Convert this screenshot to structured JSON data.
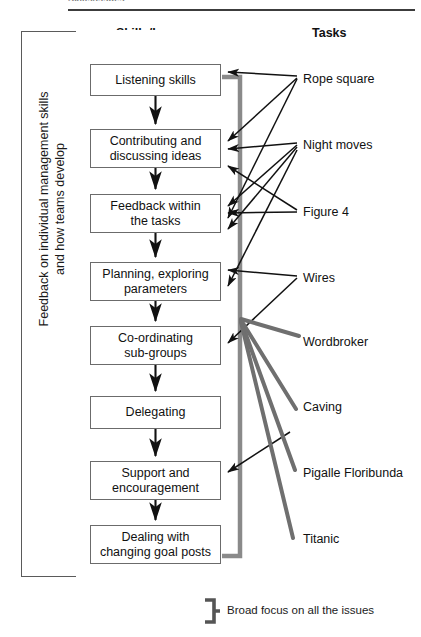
{
  "page": {
    "top_caption": "Skills/Issues",
    "width": 421,
    "height": 637
  },
  "colors": {
    "line": "#111111",
    "box_border": "#6b6b6b",
    "frame_border": "#5a5a5a",
    "bracket_gray": "#8a8a8a",
    "thick_gray": "#6f6f6f",
    "background": "#ffffff",
    "text": "#111111"
  },
  "headers": {
    "skills": "Skills/Issues",
    "tasks": "Tasks"
  },
  "feedback_frame": {
    "line1": "Feedback on individual management skills",
    "line2": "and how teams develop"
  },
  "process_boxes": [
    {
      "id": "listening-skills",
      "lines": [
        "Listening skills"
      ]
    },
    {
      "id": "contributing-ideas",
      "lines": [
        "Contributing and",
        "discussing ideas"
      ]
    },
    {
      "id": "feedback-tasks",
      "lines": [
        "Feedback within",
        "the tasks"
      ]
    },
    {
      "id": "planning-params",
      "lines": [
        "Planning, exploring",
        "parameters"
      ]
    },
    {
      "id": "coordinating",
      "lines": [
        "Co-ordinating",
        "sub-groups"
      ]
    },
    {
      "id": "delegating",
      "lines": [
        "Delegating"
      ]
    },
    {
      "id": "support",
      "lines": [
        "Support and",
        "encouragement"
      ]
    },
    {
      "id": "dealing-goalposts",
      "lines": [
        "Dealing with",
        "changing goal posts"
      ]
    }
  ],
  "tasks": [
    {
      "id": "rope-square",
      "label": "Rope square"
    },
    {
      "id": "night-moves",
      "label": "Night moves"
    },
    {
      "id": "figure-4",
      "label": "Figure 4"
    },
    {
      "id": "wires",
      "label": "Wires"
    },
    {
      "id": "wordbroker",
      "label": "Wordbroker"
    },
    {
      "id": "caving",
      "label": "Caving"
    },
    {
      "id": "pigalle-floribunda",
      "label": "Pigalle Floribunda"
    },
    {
      "id": "titanic",
      "label": "Titanic"
    }
  ],
  "legend": {
    "bracket_note": "Broad focus on all the issues"
  },
  "diagram_data": {
    "type": "flow-diagram",
    "description": "Left frame labels overall feedback theme; centre column is a top-to-bottom sequence of skills/issues boxes linked by down arrows; right column lists tasks, each linked by arrows to one or more skills boxes; a grey bracket marks tasks with broad focus on all the issues.",
    "sequence_flow": [
      "listening-skills",
      "contributing-ideas",
      "feedback-tasks",
      "planning-params",
      "coordinating",
      "delegating",
      "support",
      "dealing-goalposts"
    ],
    "task_links": [
      {
        "task": "rope-square",
        "targets": [
          "listening-skills",
          "contributing-ideas",
          "feedback-tasks"
        ]
      },
      {
        "task": "night-moves",
        "targets": [
          "contributing-ideas",
          "feedback-tasks",
          "planning-params",
          "coordinating"
        ]
      },
      {
        "task": "figure-4",
        "targets": [
          "feedback-tasks",
          "contributing-ideas"
        ]
      },
      {
        "task": "wires",
        "targets": [
          "planning-params",
          "coordinating"
        ]
      },
      {
        "task": "wordbroker",
        "targets": [
          "coordinating"
        ],
        "style": "broad-focus"
      },
      {
        "task": "caving",
        "targets": [
          "coordinating"
        ],
        "style": "broad-focus"
      },
      {
        "task": "pigalle-floribunda",
        "targets": [
          "support",
          "coordinating"
        ],
        "style": "broad-focus"
      },
      {
        "task": "titanic",
        "targets": [
          "coordinating"
        ],
        "style": "broad-focus"
      }
    ]
  }
}
